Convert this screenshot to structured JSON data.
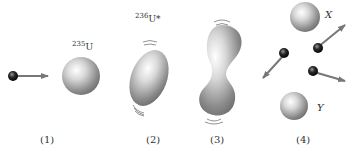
{
  "diagram": {
    "stages": [
      {
        "id": "1",
        "caption": "(1)",
        "label": "235U",
        "label_mass": "235",
        "label_symbol": "U"
      },
      {
        "id": "2",
        "caption": "(2)",
        "label": "236U*",
        "label_mass": "236",
        "label_symbol": "U*"
      },
      {
        "id": "3",
        "caption": "(3)"
      },
      {
        "id": "4",
        "caption": "(4)",
        "fragments": [
          "X",
          "Y"
        ]
      }
    ]
  }
}
